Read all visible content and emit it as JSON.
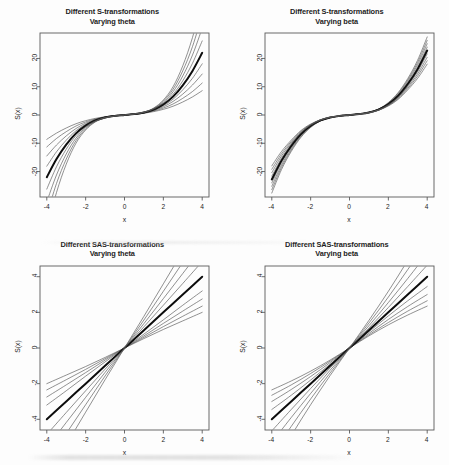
{
  "figure": {
    "background": "#fdfdfd",
    "ink": "#1c1c1c",
    "panel_count": 4
  },
  "panels": [
    {
      "id": "s-theta",
      "position": "top-left",
      "title_line1": "Different S-transformations",
      "title_line2": "Varying theta"
    },
    {
      "id": "s-beta",
      "position": "top-right",
      "title_line1": "Different S-transformations",
      "title_line2": "Varying beta"
    },
    {
      "id": "sas-theta",
      "position": "bottom-left",
      "title_line1": "Different SAS-transformations",
      "title_line2": "Varying theta"
    },
    {
      "id": "sas-beta",
      "position": "bottom-right",
      "title_line1": "Different SAS-transformations",
      "title_line2": "Varying beta"
    }
  ],
  "axes": {
    "xlabel": "x",
    "ylabel": "S(x)",
    "xticks": [
      "-4",
      "-2",
      "0",
      "2",
      "4"
    ],
    "xtick_values": [
      -4,
      -2,
      0,
      2,
      4
    ],
    "yticks_top": [
      "20",
      "10",
      "0",
      "-10",
      "-20"
    ],
    "ytick_values_top": [
      20,
      10,
      0,
      -10,
      -20
    ],
    "yticks_bottom": [
      "4",
      "2",
      "0",
      "-2",
      "-4"
    ],
    "ytick_values_bottom": [
      4,
      2,
      0,
      -2,
      -4
    ]
  },
  "chart_data": [
    {
      "type": "line",
      "id": "s-theta",
      "title": "Different S-transformations\nVarying theta",
      "xlabel": "x",
      "ylabel": "S(x)",
      "xlim": [
        -4.35,
        4.35
      ],
      "ylim": [
        -29,
        29
      ],
      "grid": false,
      "legend": null,
      "x": [
        -4,
        -3.5,
        -3,
        -2.5,
        -2,
        -1.5,
        -1,
        -0.5,
        0,
        0.5,
        1,
        1.5,
        2,
        2.5,
        3,
        3.5,
        4
      ],
      "series": [
        {
          "name": "theta = 0.2",
          "emphasis": "normal",
          "values": [
            -8.6,
            -6.4,
            -4.6,
            -3.1,
            -2.0,
            -1.2,
            -0.62,
            -0.28,
            0,
            0.28,
            0.62,
            1.2,
            2.0,
            3.1,
            4.6,
            6.4,
            8.6
          ]
        },
        {
          "name": "theta = 0.35",
          "emphasis": "normal",
          "values": [
            -11.3,
            -8.3,
            -5.9,
            -3.9,
            -2.45,
            -1.4,
            -0.7,
            -0.3,
            0,
            0.3,
            0.7,
            1.4,
            2.45,
            3.9,
            5.9,
            8.3,
            11.3
          ]
        },
        {
          "name": "theta = 0.5",
          "emphasis": "normal",
          "values": [
            -14.5,
            -10.6,
            -7.4,
            -4.8,
            -2.9,
            -1.6,
            -0.76,
            -0.31,
            0,
            0.31,
            0.76,
            1.6,
            2.9,
            4.8,
            7.4,
            10.6,
            14.5
          ]
        },
        {
          "name": "theta = 0.65",
          "emphasis": "normal",
          "values": [
            -18.1,
            -13.0,
            -8.9,
            -5.6,
            -3.3,
            -1.75,
            -0.81,
            -0.32,
            0,
            0.32,
            0.81,
            1.75,
            3.3,
            5.6,
            8.9,
            13.0,
            18.1
          ]
        },
        {
          "name": "theta = 0.8 (reference)",
          "emphasis": "bold",
          "values": [
            -22.0,
            -15.6,
            -10.5,
            -6.5,
            -3.75,
            -1.92,
            -0.86,
            -0.33,
            0,
            0.33,
            0.86,
            1.92,
            3.75,
            6.5,
            10.5,
            15.6,
            22.0
          ]
        },
        {
          "name": "theta = 0.95",
          "emphasis": "normal",
          "values": [
            -26.2,
            -18.3,
            -12.1,
            -7.3,
            -4.1,
            -2.05,
            -0.9,
            -0.34,
            0,
            0.34,
            0.9,
            2.05,
            4.1,
            7.3,
            12.1,
            18.3,
            26.2
          ]
        },
        {
          "name": "theta = 1.1",
          "emphasis": "normal",
          "values": [
            -30.7,
            -21.2,
            -13.8,
            -8.2,
            -4.5,
            -2.2,
            -0.94,
            -0.35,
            0,
            0.35,
            0.94,
            2.2,
            4.5,
            8.2,
            13.8,
            21.2,
            30.7
          ]
        },
        {
          "name": "theta = 1.25",
          "emphasis": "normal",
          "values": [
            -35.5,
            -24.2,
            -15.6,
            -9.1,
            -4.9,
            -2.33,
            -0.98,
            -0.36,
            0,
            0.36,
            0.98,
            2.33,
            4.9,
            9.1,
            15.6,
            24.2,
            35.5
          ]
        },
        {
          "name": "theta = 1.4",
          "emphasis": "normal",
          "values": [
            -40.6,
            -27.4,
            -17.4,
            -10.0,
            -5.3,
            -2.46,
            -1.01,
            -0.37,
            0,
            0.37,
            1.01,
            2.46,
            5.3,
            10.0,
            17.4,
            27.4,
            40.6
          ]
        }
      ]
    },
    {
      "type": "line",
      "id": "s-beta",
      "title": "Different S-transformations\nVarying beta",
      "xlabel": "x",
      "ylabel": "S(x)",
      "xlim": [
        -4.35,
        4.35
      ],
      "ylim": [
        -29,
        29
      ],
      "grid": false,
      "legend": null,
      "x": [
        -4,
        -3.5,
        -3,
        -2.5,
        -2,
        -1.5,
        -1,
        -0.5,
        0,
        0.5,
        1,
        1.5,
        2,
        2.5,
        3,
        3.5,
        4
      ],
      "series": [
        {
          "name": "beta = 0.6",
          "emphasis": "normal",
          "values": [
            -27.6,
            -19.3,
            -12.9,
            -7.9,
            -4.4,
            -2.15,
            -0.95,
            -0.36,
            0,
            0.36,
            0.95,
            2.15,
            4.4,
            7.9,
            12.9,
            19.3,
            27.6
          ]
        },
        {
          "name": "beta = 0.8",
          "emphasis": "normal",
          "values": [
            -26.4,
            -18.5,
            -12.4,
            -7.6,
            -4.25,
            -2.1,
            -0.93,
            -0.355,
            0,
            0.355,
            0.93,
            2.1,
            4.25,
            7.6,
            12.4,
            18.5,
            26.4
          ]
        },
        {
          "name": "beta = 1.0",
          "emphasis": "normal",
          "values": [
            -25.2,
            -17.7,
            -11.9,
            -7.3,
            -4.1,
            -2.04,
            -0.91,
            -0.35,
            0,
            0.35,
            0.91,
            2.04,
            4.1,
            7.3,
            11.9,
            17.7,
            25.2
          ]
        },
        {
          "name": "beta = 1.2",
          "emphasis": "normal",
          "values": [
            -24.0,
            -16.9,
            -11.4,
            -7.0,
            -3.95,
            -1.98,
            -0.89,
            -0.345,
            0,
            0.345,
            0.89,
            1.98,
            3.95,
            7.0,
            11.4,
            16.9,
            24.0
          ]
        },
        {
          "name": "beta = 1.4 (reference)",
          "emphasis": "bold",
          "values": [
            -22.8,
            -16.1,
            -10.9,
            -6.7,
            -3.8,
            -1.92,
            -0.87,
            -0.34,
            0,
            0.34,
            0.87,
            1.92,
            3.8,
            6.7,
            10.9,
            16.1,
            22.8
          ]
        },
        {
          "name": "beta = 1.6",
          "emphasis": "normal",
          "values": [
            -21.6,
            -15.3,
            -10.4,
            -6.4,
            -3.65,
            -1.86,
            -0.85,
            -0.335,
            0,
            0.335,
            0.85,
            1.86,
            3.65,
            6.4,
            10.4,
            15.3,
            21.6
          ]
        },
        {
          "name": "beta = 1.8",
          "emphasis": "normal",
          "values": [
            -20.4,
            -14.5,
            -9.9,
            -6.1,
            -3.5,
            -1.8,
            -0.83,
            -0.33,
            0,
            0.33,
            0.83,
            1.8,
            3.5,
            6.1,
            9.9,
            14.5,
            20.4
          ]
        },
        {
          "name": "beta = 2.0",
          "emphasis": "normal",
          "values": [
            -19.2,
            -13.7,
            -9.4,
            -5.8,
            -3.35,
            -1.74,
            -0.81,
            -0.325,
            0,
            0.325,
            0.81,
            1.74,
            3.35,
            5.8,
            9.4,
            13.7,
            19.2
          ]
        },
        {
          "name": "beta = 2.2",
          "emphasis": "normal",
          "values": [
            -18.0,
            -12.9,
            -8.9,
            -5.5,
            -3.2,
            -1.68,
            -0.79,
            -0.32,
            0,
            0.32,
            0.79,
            1.68,
            3.2,
            5.5,
            8.9,
            12.9,
            18.0
          ]
        }
      ]
    },
    {
      "type": "line",
      "id": "sas-theta",
      "title": "Different SAS-transformations\nVarying theta",
      "xlabel": "x",
      "ylabel": "S(x)",
      "xlim": [
        -4.35,
        4.35
      ],
      "ylim": [
        -4.6,
        4.6
      ],
      "grid": false,
      "legend": null,
      "x": [
        -4,
        -3,
        -2,
        -1,
        0,
        1,
        2,
        3,
        4
      ],
      "series": [
        {
          "name": "theta = 0.5",
          "emphasis": "normal",
          "values": [
            -2.0,
            -1.52,
            -1.04,
            -0.53,
            0,
            0.53,
            1.04,
            1.52,
            2.0
          ]
        },
        {
          "name": "theta = 0.65",
          "emphasis": "normal",
          "values": [
            -2.35,
            -1.78,
            -1.2,
            -0.6,
            0,
            0.6,
            1.2,
            1.78,
            2.35
          ]
        },
        {
          "name": "theta = 0.8",
          "emphasis": "normal",
          "values": [
            -2.75,
            -2.07,
            -1.38,
            -0.68,
            0,
            0.68,
            1.38,
            2.07,
            2.75
          ]
        },
        {
          "name": "theta = 0.95",
          "emphasis": "normal",
          "values": [
            -3.2,
            -2.4,
            -1.58,
            -0.78,
            0,
            0.78,
            1.58,
            2.4,
            3.2
          ]
        },
        {
          "name": "theta = 1.1 (reference)",
          "emphasis": "bold",
          "values": [
            -4.0,
            -3.0,
            -2.0,
            -1.0,
            0,
            1.0,
            2.0,
            3.0,
            4.0
          ]
        },
        {
          "name": "theta = 1.25",
          "emphasis": "normal",
          "values": [
            -4.85,
            -3.62,
            -2.4,
            -1.19,
            0,
            1.19,
            2.4,
            3.62,
            4.85
          ]
        },
        {
          "name": "theta = 1.4",
          "emphasis": "normal",
          "values": [
            -5.6,
            -4.18,
            -2.77,
            -1.37,
            0,
            1.37,
            2.77,
            4.18,
            5.6
          ]
        },
        {
          "name": "theta = 1.55",
          "emphasis": "normal",
          "values": [
            -6.45,
            -4.8,
            -3.18,
            -1.57,
            0,
            1.57,
            3.18,
            4.8,
            6.45
          ]
        },
        {
          "name": "theta = 1.7",
          "emphasis": "normal",
          "values": [
            -7.3,
            -5.43,
            -3.6,
            -1.78,
            0,
            1.78,
            3.6,
            5.43,
            7.3
          ]
        }
      ]
    },
    {
      "type": "line",
      "id": "sas-beta",
      "title": "Different SAS-transformations\nVarying beta",
      "xlabel": "x",
      "ylabel": "S(x)",
      "xlim": [
        -4.35,
        4.35
      ],
      "ylim": [
        -4.6,
        4.6
      ],
      "grid": false,
      "legend": null,
      "x": [
        -4,
        -3,
        -2,
        -1,
        0,
        1,
        2,
        3,
        4
      ],
      "series": [
        {
          "name": "beta = 0.6",
          "emphasis": "normal",
          "values": [
            -2.35,
            -1.85,
            -1.3,
            -0.68,
            0,
            0.68,
            1.3,
            1.85,
            2.35
          ]
        },
        {
          "name": "beta = 0.8",
          "emphasis": "normal",
          "values": [
            -2.65,
            -2.07,
            -1.43,
            -0.74,
            0,
            0.74,
            1.43,
            2.07,
            2.65
          ]
        },
        {
          "name": "beta = 1.0",
          "emphasis": "normal",
          "values": [
            -3.0,
            -2.33,
            -1.6,
            -0.82,
            0,
            0.82,
            1.6,
            2.33,
            3.0
          ]
        },
        {
          "name": "beta = 1.2",
          "emphasis": "normal",
          "values": [
            -3.45,
            -2.65,
            -1.8,
            -0.91,
            0,
            0.91,
            1.8,
            2.65,
            3.45
          ]
        },
        {
          "name": "beta = 1.4 (reference)",
          "emphasis": "bold",
          "values": [
            -4.0,
            -3.0,
            -2.0,
            -1.0,
            0,
            1.0,
            2.0,
            3.0,
            4.0
          ]
        },
        {
          "name": "beta = 1.6",
          "emphasis": "normal",
          "values": [
            -4.65,
            -3.45,
            -2.27,
            -1.12,
            0,
            1.12,
            2.27,
            3.45,
            4.65
          ]
        },
        {
          "name": "beta = 1.8",
          "emphasis": "normal",
          "values": [
            -5.3,
            -3.9,
            -2.55,
            -1.25,
            0,
            1.25,
            2.55,
            3.9,
            5.3
          ]
        },
        {
          "name": "beta = 2.0",
          "emphasis": "normal",
          "values": [
            -6.0,
            -4.4,
            -2.86,
            -1.4,
            0,
            1.4,
            2.86,
            4.4,
            6.0
          ]
        },
        {
          "name": "beta = 2.2",
          "emphasis": "normal",
          "values": [
            -6.75,
            -4.92,
            -3.18,
            -1.55,
            0,
            1.55,
            3.18,
            4.92,
            6.75
          ]
        }
      ]
    }
  ]
}
